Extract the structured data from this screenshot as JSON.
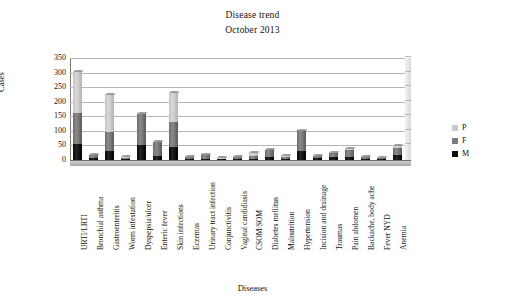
{
  "chart_data": {
    "type": "bar",
    "title": "Disease trend",
    "subtitle": "October 2013",
    "xlabel": "Diseases",
    "ylabel": "Cases",
    "ylim": [
      0,
      350
    ],
    "yticks": [
      0,
      50,
      100,
      150,
      200,
      250,
      300,
      350
    ],
    "grid": true,
    "stacked": true,
    "legend_position": "right",
    "categories": [
      "URTI/LRTI",
      "Bronchial asthma",
      "Gastroenteritis",
      "Worm infestation",
      "Dyspepsia/ulcer",
      "Enteric fever",
      "Skin infections",
      "Eczemas",
      "Urinary tract infection",
      "Conjunctivitis",
      "Vaginal candidiasis",
      "CSOM/SOM",
      "Diabetes mellitus",
      "Malnutrition",
      "Hypertension",
      "Incision and drainage",
      "Traumas",
      "Pain abdomen",
      "Backache, body ache",
      "Fever NYD",
      "Anemia"
    ],
    "series": [
      {
        "name": "M",
        "color": "#0c0c0c",
        "values": [
          55,
          7,
          30,
          3,
          52,
          13,
          45,
          4,
          5,
          2,
          2,
          5,
          10,
          5,
          30,
          6,
          11,
          12,
          5,
          3,
          18
        ]
      },
      {
        "name": "F",
        "color": "#7b7b7b",
        "values": [
          105,
          10,
          65,
          4,
          105,
          50,
          85,
          7,
          14,
          3,
          9,
          10,
          24,
          7,
          72,
          9,
          13,
          22,
          6,
          4,
          22
        ]
      },
      {
        "name": "P",
        "color": "#c9c9c9",
        "values": [
          145,
          2,
          133,
          8,
          3,
          2,
          105,
          2,
          2,
          6,
          3,
          12,
          4,
          5,
          1,
          2,
          2,
          6,
          2,
          5,
          12
        ]
      }
    ],
    "totals": [
      305,
      19,
      228,
      15,
      160,
      65,
      235,
      13,
      21,
      11,
      14,
      27,
      38,
      17,
      103,
      17,
      26,
      40,
      13,
      12,
      52
    ]
  },
  "legend": {
    "items": [
      {
        "label": "P",
        "color": "#c9c9c9"
      },
      {
        "label": "F",
        "color": "#7b7b7b"
      },
      {
        "label": "M",
        "color": "#0c0c0c"
      }
    ]
  }
}
